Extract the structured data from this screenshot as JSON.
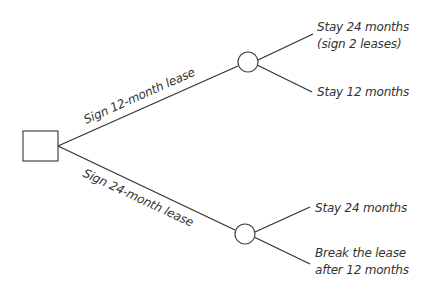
{
  "diagram": {
    "type": "decision-tree",
    "decision_node": {
      "label": ""
    },
    "branches": [
      {
        "label": "Sign 12-month lease",
        "outcomes": [
          {
            "line1": "Stay 24 months",
            "line2": "(sign 2 leases)"
          },
          {
            "line1": "Stay 12 months",
            "line2": ""
          }
        ]
      },
      {
        "label": "Sign 24-month lease",
        "outcomes": [
          {
            "line1": "Stay 24 months",
            "line2": ""
          },
          {
            "line1": "Break the lease",
            "line2": "after 12 months"
          }
        ]
      }
    ],
    "colors": {
      "line": "#333333",
      "background": "#ffffff"
    }
  }
}
